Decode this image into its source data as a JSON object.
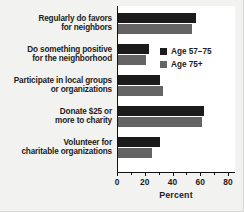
{
  "chart_data": {
    "type": "bar",
    "orientation": "horizontal",
    "title": "",
    "xlabel": "Percent",
    "ylabel": "",
    "xlim": [
      0,
      80
    ],
    "xticks": [
      0,
      20,
      40,
      60,
      80
    ],
    "xticklabels": [
      "0",
      "20",
      "40",
      "60",
      "80"
    ],
    "minor_xticks": [
      10,
      30,
      50,
      70
    ],
    "grid": false,
    "legend_position": "upper right inside plot",
    "categories": [
      "Regularly do favors for neighbors",
      "Do something positive for the neighborhood",
      "Participate in local groups or organizations",
      "Donate $25 or more to charity",
      "Volunteer for charitable organizations"
    ],
    "category_lines": [
      [
        "Regularly do favors",
        "for neighbors"
      ],
      [
        "Do something positive",
        "for the neighborhood"
      ],
      [
        "Participate in local groups",
        "or organizations"
      ],
      [
        "Donate $25 or",
        "more to charity"
      ],
      [
        "Volunteer for",
        "charitable organizations"
      ]
    ],
    "series": [
      {
        "name": "Age 57–75",
        "color": "#1b1b1b",
        "values": [
          57,
          23,
          31,
          63,
          31
        ]
      },
      {
        "name": "Age 75+",
        "color": "#646464",
        "values": [
          54,
          21,
          33,
          61,
          25
        ]
      }
    ]
  },
  "legend": {
    "items": [
      {
        "label": "Age 57–75",
        "color": "#1b1b1b"
      },
      {
        "label": "Age 75+",
        "color": "#646464"
      }
    ]
  },
  "axis": {
    "x_title": "Percent",
    "ticks": [
      {
        "label": "0",
        "value": 0
      },
      {
        "label": "20",
        "value": 20
      },
      {
        "label": "40",
        "value": 40
      },
      {
        "label": "60",
        "value": 60
      },
      {
        "label": "80",
        "value": 80
      }
    ]
  },
  "colors": {
    "background": "#f2f2f0",
    "plot_background": "#ffffff",
    "axis": "#111111",
    "text": "#1c1c1c",
    "series_dark": "#1b1b1b",
    "series_gray": "#646464"
  }
}
